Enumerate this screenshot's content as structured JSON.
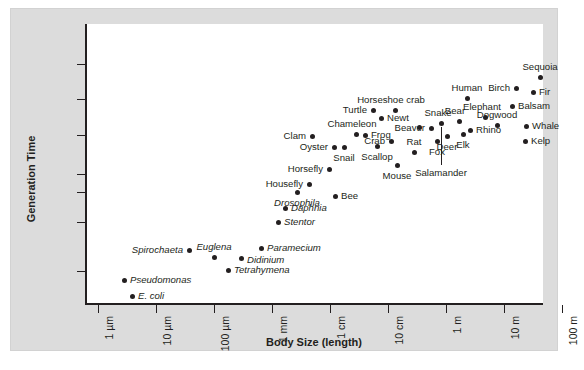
{
  "chart_data": {
    "type": "scatter",
    "title": "",
    "xlabel": "Body Size (length)",
    "ylabel": "Generation Time",
    "grid": false,
    "legend": "none",
    "xscale": "log",
    "yscale": "log",
    "xticks": [
      "1 µm",
      "10 µm",
      "100 µm",
      "1 mm",
      "1 cm",
      "10 cm",
      "1 m",
      "10 m",
      "100 m"
    ],
    "yticks": [
      "100 years",
      "10 years",
      "1 year",
      "1 month",
      "1 week",
      "1 day",
      "1 hour"
    ],
    "ytick_px": [
      40,
      75,
      111,
      150,
      168,
      198,
      247
    ],
    "xtick_px": [
      13,
      71,
      129,
      187,
      245,
      303,
      361,
      419,
      477
    ],
    "points": [
      {
        "name": "Pseudomonas",
        "italic": true,
        "px": 39,
        "py": 256,
        "side": "l",
        "lx": 6,
        "ly": 0
      },
      {
        "name": "E. coli",
        "italic": true,
        "px": 47,
        "py": 272,
        "side": "l",
        "lx": 6,
        "ly": 0
      },
      {
        "name": "Spirochaeta",
        "italic": true,
        "px": 104,
        "py": 226,
        "side": "r",
        "lx": -6,
        "ly": 0
      },
      {
        "name": "Euglena",
        "italic": true,
        "px": 129,
        "py": 233,
        "side": "c",
        "lx": 0,
        "ly": -10
      },
      {
        "name": "Tetrahymena",
        "italic": true,
        "px": 143,
        "py": 246,
        "side": "l",
        "lx": 6,
        "ly": 0
      },
      {
        "name": "Didinium",
        "italic": true,
        "px": 156,
        "py": 234,
        "side": "l",
        "lx": 6,
        "ly": 2
      },
      {
        "name": "Paramecium",
        "italic": true,
        "px": 176,
        "py": 224,
        "side": "l",
        "lx": 6,
        "ly": 0
      },
      {
        "name": "Stentor",
        "italic": true,
        "px": 193,
        "py": 198,
        "side": "l",
        "lx": 6,
        "ly": 0
      },
      {
        "name": "Daphnia",
        "italic": true,
        "px": 200,
        "py": 184,
        "side": "l",
        "lx": 6,
        "ly": 0
      },
      {
        "name": "Drosophila",
        "italic": true,
        "px": 212,
        "py": 168,
        "side": "c",
        "lx": 0,
        "ly": 11
      },
      {
        "name": "Housefly",
        "italic": false,
        "px": 224,
        "py": 160,
        "side": "r",
        "lx": -6,
        "ly": 0
      },
      {
        "name": "Bee",
        "italic": false,
        "px": 250,
        "py": 172,
        "side": "l",
        "lx": 6,
        "ly": 0
      },
      {
        "name": "Horsefly",
        "italic": false,
        "px": 244,
        "py": 145,
        "side": "r",
        "lx": -6,
        "ly": 0
      },
      {
        "name": "Clam",
        "italic": false,
        "px": 227,
        "py": 112,
        "side": "r",
        "lx": -6,
        "ly": 0
      },
      {
        "name": "Oyster",
        "italic": false,
        "px": 249,
        "py": 123,
        "side": "r",
        "lx": -6,
        "ly": 0
      },
      {
        "name": "Snail",
        "italic": false,
        "px": 259,
        "py": 123,
        "side": "c",
        "lx": 0,
        "ly": 11
      },
      {
        "name": "Chameleon",
        "italic": false,
        "px": 271,
        "py": 110,
        "side": "c",
        "lx": -4,
        "ly": -10
      },
      {
        "name": "Frog",
        "italic": false,
        "px": 280,
        "py": 111,
        "side": "l",
        "lx": 6,
        "ly": 0
      },
      {
        "name": "Scallop",
        "italic": false,
        "px": 292,
        "py": 122,
        "side": "c",
        "lx": 0,
        "ly": 11
      },
      {
        "name": "Crab",
        "italic": false,
        "px": 306,
        "py": 117,
        "side": "r",
        "lx": -6,
        "ly": 0
      },
      {
        "name": "Mouse",
        "italic": false,
        "px": 312,
        "py": 141,
        "side": "c",
        "lx": 0,
        "ly": 11
      },
      {
        "name": "Newt",
        "italic": false,
        "px": 296,
        "py": 94,
        "side": "l",
        "lx": 6,
        "ly": 0
      },
      {
        "name": "Turtle",
        "italic": false,
        "px": 288,
        "py": 86,
        "side": "r",
        "lx": -6,
        "ly": 0
      },
      {
        "name": "Horseshoe crab",
        "italic": false,
        "px": 310,
        "py": 86,
        "side": "c",
        "lx": -4,
        "ly": -10
      },
      {
        "name": "Rat",
        "italic": false,
        "px": 329,
        "py": 128,
        "side": "c",
        "lx": 0,
        "ly": -10
      },
      {
        "name": "Beaver",
        "italic": false,
        "px": 346,
        "py": 104,
        "side": "r",
        "lx": -6,
        "ly": 0
      },
      {
        "name": "Snake",
        "italic": false,
        "px": 356,
        "py": 99,
        "side": "c",
        "lx": -3,
        "ly": -10
      },
      {
        "name": "Fox",
        "italic": false,
        "px": 352,
        "py": 117,
        "side": "c",
        "lx": 0,
        "ly": 11
      },
      {
        "name": "Salamander",
        "italic": false,
        "px": 334,
        "py": 103,
        "side": "c",
        "lx": 22,
        "ly": 46,
        "leader": true
      },
      {
        "name": "Deer",
        "italic": false,
        "px": 362,
        "py": 112,
        "side": "c",
        "lx": 0,
        "ly": 11
      },
      {
        "name": "Elk",
        "italic": false,
        "px": 378,
        "py": 110,
        "side": "c",
        "lx": 0,
        "ly": 11
      },
      {
        "name": "Bear",
        "italic": false,
        "px": 374,
        "py": 97,
        "side": "c",
        "lx": -4,
        "ly": -10
      },
      {
        "name": "Rhino",
        "italic": false,
        "px": 385,
        "py": 106,
        "side": "l",
        "lx": 6,
        "ly": 0
      },
      {
        "name": "Human",
        "italic": false,
        "px": 382,
        "py": 74,
        "side": "c",
        "lx": 0,
        "ly": -10
      },
      {
        "name": "Elephant",
        "italic": false,
        "px": 400,
        "py": 93,
        "side": "c",
        "lx": -3,
        "ly": -10
      },
      {
        "name": "Dogwood",
        "italic": false,
        "px": 412,
        "py": 101,
        "side": "c",
        "lx": 0,
        "ly": -10
      },
      {
        "name": "Birch",
        "italic": false,
        "px": 431,
        "py": 64,
        "side": "r",
        "lx": -6,
        "ly": 0
      },
      {
        "name": "Balsam",
        "italic": false,
        "px": 427,
        "py": 82,
        "side": "l",
        "lx": 6,
        "ly": 0
      },
      {
        "name": "Whale",
        "italic": false,
        "px": 441,
        "py": 102,
        "side": "l",
        "lx": 6,
        "ly": 0
      },
      {
        "name": "Kelp",
        "italic": false,
        "px": 440,
        "py": 117,
        "side": "l",
        "lx": 6,
        "ly": 0
      },
      {
        "name": "Fir",
        "italic": false,
        "px": 448,
        "py": 68,
        "side": "l",
        "lx": 6,
        "ly": 0
      },
      {
        "name": "Sequoia",
        "italic": false,
        "px": 455,
        "py": 53,
        "side": "c",
        "lx": 0,
        "ly": -10
      }
    ]
  }
}
